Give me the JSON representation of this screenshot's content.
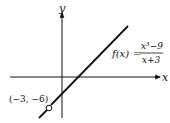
{
  "figure": {
    "type": "function graph",
    "axes": {
      "x_label": "x",
      "y_label": "y"
    },
    "function": {
      "name": "f(x)",
      "equals": "=",
      "numerator": "x³−9",
      "denominator": "x+3"
    },
    "hole_point": {
      "label": "(−3, −6)",
      "x": -3,
      "y": -6
    },
    "colors": {
      "line": "#111111",
      "background": "#ffffff"
    }
  }
}
